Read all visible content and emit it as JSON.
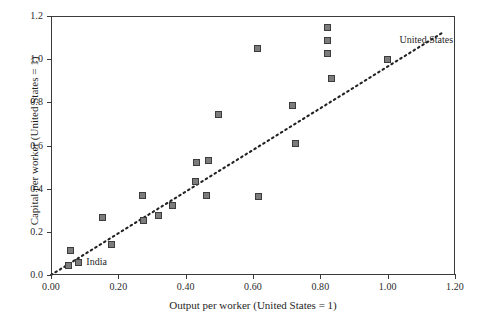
{
  "chart_data": {
    "type": "scatter",
    "title": "",
    "xlabel": "Output per worker (United States = 1)",
    "ylabel": "Capital per worker (United States = 1)",
    "xlim": [
      0.0,
      1.2
    ],
    "ylim": [
      0.0,
      1.2
    ],
    "xticks": [
      "0.00",
      "0.20",
      "0.40",
      "0.60",
      "0.80",
      "1.00",
      "1.20"
    ],
    "xtick_values": [
      0.0,
      0.2,
      0.4,
      0.6,
      0.8,
      1.0,
      1.2
    ],
    "yticks": [
      "0.0",
      "0.2",
      "0.4",
      "0.6",
      "0.8",
      "1.0",
      "1.2"
    ],
    "ytick_values": [
      0.0,
      0.2,
      0.4,
      0.6,
      0.8,
      1.0,
      1.2
    ],
    "grid": false,
    "legend": "none",
    "marker_style": "filled-square",
    "marker_fill": "#7c7c7c",
    "marker_edge": "#3c3c3c",
    "axis_color": "#3a3a3a",
    "points": [
      {
        "x": 0.054,
        "y": 0.04
      },
      {
        "x": 0.06,
        "y": 0.11
      },
      {
        "x": 0.082,
        "y": 0.055,
        "label": "India"
      },
      {
        "x": 0.155,
        "y": 0.262
      },
      {
        "x": 0.182,
        "y": 0.14
      },
      {
        "x": 0.272,
        "y": 0.365
      },
      {
        "x": 0.276,
        "y": 0.248
      },
      {
        "x": 0.322,
        "y": 0.272
      },
      {
        "x": 0.362,
        "y": 0.32
      },
      {
        "x": 0.432,
        "y": 0.43
      },
      {
        "x": 0.435,
        "y": 0.518
      },
      {
        "x": 0.462,
        "y": 0.368
      },
      {
        "x": 0.468,
        "y": 0.528
      },
      {
        "x": 0.5,
        "y": 0.74
      },
      {
        "x": 0.616,
        "y": 1.046
      },
      {
        "x": 0.618,
        "y": 0.362
      },
      {
        "x": 0.718,
        "y": 0.784
      },
      {
        "x": 0.728,
        "y": 0.608
      },
      {
        "x": 0.822,
        "y": 1.146
      },
      {
        "x": 0.824,
        "y": 1.086
      },
      {
        "x": 0.824,
        "y": 1.022
      },
      {
        "x": 0.836,
        "y": 0.908
      },
      {
        "x": 1.0,
        "y": 0.996,
        "label": "United States"
      }
    ],
    "trendline": {
      "style": "dotted",
      "color": "#222222",
      "x_start": 0.0,
      "y_start": 0.0,
      "x_end": 1.165,
      "y_end": 1.125
    },
    "annotations": [
      {
        "text": "India",
        "x": 0.105,
        "y": 0.055
      },
      {
        "text": "United States",
        "x": 1.035,
        "y": 1.085
      }
    ]
  }
}
